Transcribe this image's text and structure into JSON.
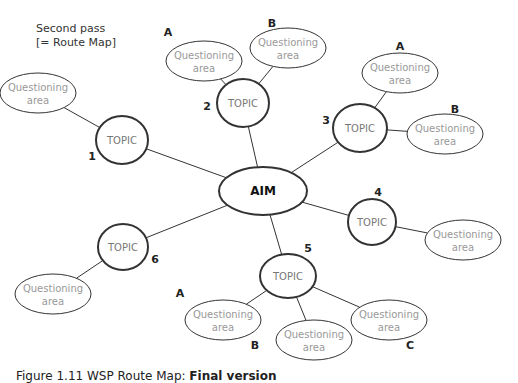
{
  "header": {
    "title_line1": "Second pass",
    "title_line2": "[= Route Map]"
  },
  "center": {
    "label": "AIM",
    "x": 263,
    "y": 191,
    "rx": 44,
    "ry": 24
  },
  "topic_label": "TOPIC",
  "qa_label_line1": "Questioning",
  "qa_label_line2": "area",
  "topics": [
    {
      "number": "1",
      "x": 122,
      "y": 140,
      "rx": 26,
      "ry": 24,
      "num_x": 92,
      "num_y": 160,
      "areas": [
        {
          "letter": "",
          "x": 38,
          "y": 93,
          "lx": 0,
          "ly": 0
        }
      ]
    },
    {
      "number": "2",
      "x": 243,
      "y": 103,
      "rx": 26,
      "ry": 24,
      "num_x": 207,
      "num_y": 110,
      "areas": [
        {
          "letter": "A",
          "x": 204,
          "y": 61,
          "lx": 168,
          "ly": 36
        },
        {
          "letter": "B",
          "x": 288,
          "y": 48,
          "lx": 272,
          "ly": 27
        }
      ]
    },
    {
      "number": "3",
      "x": 360,
      "y": 128,
      "rx": 27,
      "ry": 24,
      "num_x": 326,
      "num_y": 124,
      "areas": [
        {
          "letter": "A",
          "x": 400,
          "y": 73,
          "lx": 400,
          "ly": 50
        },
        {
          "letter": "B",
          "x": 445,
          "y": 134,
          "lx": 455,
          "ly": 113
        }
      ]
    },
    {
      "number": "4",
      "x": 372,
      "y": 222,
      "rx": 24,
      "ry": 23,
      "num_x": 378,
      "num_y": 196,
      "areas": [
        {
          "letter": "",
          "x": 463,
          "y": 240,
          "lx": 0,
          "ly": 0
        }
      ]
    },
    {
      "number": "5",
      "x": 288,
      "y": 276,
      "rx": 28,
      "ry": 22,
      "num_x": 308,
      "num_y": 252,
      "areas": [
        {
          "letter": "A",
          "x": 223,
          "y": 320,
          "lx": 180,
          "ly": 297
        },
        {
          "letter": "B",
          "x": 314,
          "y": 340,
          "lx": 255,
          "ly": 349
        },
        {
          "letter": "C",
          "x": 389,
          "y": 320,
          "lx": 410,
          "ly": 349
        }
      ]
    },
    {
      "number": "6",
      "x": 123,
      "y": 247,
      "rx": 25,
      "ry": 23,
      "num_x": 155,
      "num_y": 263,
      "areas": [
        {
          "letter": "",
          "x": 53,
          "y": 294,
          "lx": 0,
          "ly": 0
        }
      ]
    }
  ],
  "caption": {
    "prefix": "Figure 1.11 WSP Route Map: ",
    "bold": "Final version"
  },
  "colors": {
    "stroke": "#333333",
    "qa_text": "#999999",
    "topic_text": "#777777"
  }
}
